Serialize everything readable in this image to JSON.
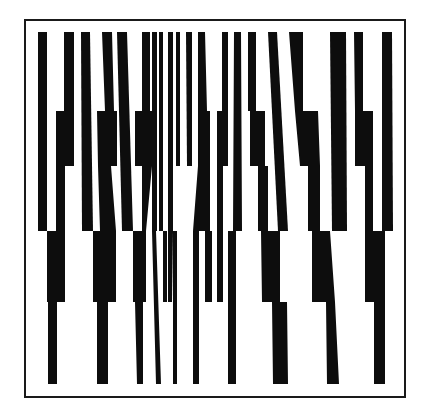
{
  "artwork": {
    "title": "",
    "background": "#ffffff",
    "ink": "#0d0d0d",
    "frame": {
      "x": 25,
      "y": 20,
      "width": 380,
      "height": 377,
      "stroke": "#1a1a1a"
    },
    "bands_y": [
      32,
      111,
      166,
      231,
      302,
      384
    ],
    "bars": [
      [
        [
          38,
          32
        ],
        [
          47,
          32
        ],
        [
          47,
          231
        ],
        [
          38,
          231
        ]
      ],
      [
        [
          64,
          32
        ],
        [
          74,
          32
        ],
        [
          74,
          111
        ],
        [
          74,
          166
        ],
        [
          65,
          166
        ],
        [
          65,
          302
        ],
        [
          57,
          302
        ],
        [
          57,
          384
        ],
        [
          48,
          384
        ],
        [
          48,
          302
        ],
        [
          47,
          302
        ],
        [
          47,
          231
        ],
        [
          56,
          231
        ],
        [
          56,
          111
        ],
        [
          64,
          111
        ]
      ],
      [
        [
          81,
          32
        ],
        [
          90,
          32
        ],
        [
          93,
          231
        ],
        [
          82,
          231
        ]
      ],
      [
        [
          102,
          32
        ],
        [
          112,
          32
        ],
        [
          114,
          111
        ],
        [
          117,
          111
        ],
        [
          117,
          166
        ],
        [
          111,
          166
        ],
        [
          116,
          231
        ],
        [
          116,
          302
        ],
        [
          108,
          302
        ],
        [
          108,
          384
        ],
        [
          97,
          384
        ],
        [
          97,
          302
        ],
        [
          93,
          302
        ],
        [
          93,
          231
        ],
        [
          100,
          231
        ],
        [
          98,
          166
        ],
        [
          97,
          111
        ],
        [
          105,
          111
        ]
      ],
      [
        [
          117,
          32
        ],
        [
          127,
          32
        ],
        [
          133,
          231
        ],
        [
          122,
          231
        ]
      ],
      [
        [
          142,
          32
        ],
        [
          150,
          32
        ],
        [
          150,
          111
        ],
        [
          152,
          111
        ],
        [
          152,
          166
        ],
        [
          146,
          231
        ],
        [
          146,
          302
        ],
        [
          143,
          302
        ],
        [
          143,
          384
        ],
        [
          137,
          384
        ],
        [
          135,
          302
        ],
        [
          133,
          302
        ],
        [
          133,
          231
        ],
        [
          142,
          231
        ],
        [
          142,
          166
        ],
        [
          135,
          166
        ],
        [
          135,
          111
        ],
        [
          142,
          111
        ]
      ],
      [
        [
          152,
          32
        ],
        [
          157,
          32
        ],
        [
          157,
          231
        ],
        [
          156,
          231
        ],
        [
          161,
          384
        ],
        [
          156,
          384
        ],
        [
          152,
          231
        ]
      ],
      [
        [
          159,
          32
        ],
        [
          163,
          32
        ],
        [
          163,
          231
        ],
        [
          167,
          231
        ],
        [
          167,
          302
        ],
        [
          163,
          302
        ],
        [
          163,
          231
        ],
        [
          159,
          231
        ]
      ],
      [
        [
          168,
          32
        ],
        [
          173,
          32
        ],
        [
          173,
          231
        ],
        [
          172,
          302
        ],
        [
          168,
          302
        ],
        [
          168,
          231
        ]
      ],
      [
        [
          176,
          32
        ],
        [
          180,
          32
        ],
        [
          180,
          166
        ],
        [
          176,
          166
        ]
      ],
      [
        [
          173,
          231
        ],
        [
          177,
          231
        ],
        [
          177,
          384
        ],
        [
          173,
          384
        ]
      ],
      [
        [
          186,
          32
        ],
        [
          192,
          32
        ],
        [
          192,
          166
        ],
        [
          187,
          166
        ]
      ],
      [
        [
          198,
          32
        ],
        [
          205,
          32
        ],
        [
          207,
          111
        ],
        [
          210,
          111
        ],
        [
          210,
          231
        ],
        [
          199,
          231
        ],
        [
          199,
          384
        ],
        [
          193,
          384
        ],
        [
          193,
          231
        ],
        [
          198,
          166
        ]
      ],
      [
        [
          205,
          231
        ],
        [
          212,
          231
        ],
        [
          212,
          302
        ],
        [
          205,
          302
        ]
      ],
      [
        [
          222,
          32
        ],
        [
          228,
          32
        ],
        [
          228,
          166
        ],
        [
          223,
          166
        ],
        [
          223,
          302
        ],
        [
          217,
          302
        ],
        [
          217,
          166
        ],
        [
          217,
          111
        ],
        [
          222,
          111
        ]
      ],
      [
        [
          234,
          32
        ],
        [
          241,
          32
        ],
        [
          242,
          231
        ],
        [
          236,
          231
        ],
        [
          236,
          384
        ],
        [
          228,
          384
        ],
        [
          228,
          231
        ],
        [
          233,
          231
        ]
      ],
      [
        [
          248,
          32
        ],
        [
          256,
          32
        ],
        [
          256,
          111
        ],
        [
          265,
          111
        ],
        [
          265,
          166
        ],
        [
          268,
          166
        ],
        [
          268,
          231
        ],
        [
          280,
          231
        ],
        [
          280,
          302
        ],
        [
          287,
          302
        ],
        [
          288,
          384
        ],
        [
          273,
          384
        ],
        [
          272,
          302
        ],
        [
          262,
          302
        ],
        [
          261,
          231
        ],
        [
          258,
          231
        ],
        [
          258,
          166
        ],
        [
          250,
          166
        ],
        [
          250,
          111
        ],
        [
          248,
          111
        ]
      ],
      [
        [
          268,
          32
        ],
        [
          277,
          32
        ],
        [
          288,
          231
        ],
        [
          278,
          231
        ]
      ],
      [
        [
          289,
          32
        ],
        [
          303,
          32
        ],
        [
          303,
          111
        ],
        [
          318,
          111
        ],
        [
          320,
          166
        ],
        [
          320,
          231
        ],
        [
          330,
          231
        ],
        [
          335,
          302
        ],
        [
          339,
          384
        ],
        [
          327,
          384
        ],
        [
          326,
          302
        ],
        [
          312,
          302
        ],
        [
          312,
          231
        ],
        [
          308,
          231
        ],
        [
          308,
          166
        ],
        [
          300,
          166
        ],
        [
          295,
          111
        ]
      ],
      [
        [
          330,
          32
        ],
        [
          346,
          32
        ],
        [
          347,
          231
        ],
        [
          332,
          231
        ]
      ],
      [
        [
          354,
          32
        ],
        [
          363,
          32
        ],
        [
          363,
          111
        ],
        [
          373,
          111
        ],
        [
          373,
          166
        ],
        [
          373,
          231
        ],
        [
          385,
          231
        ],
        [
          385,
          302
        ],
        [
          385,
          384
        ],
        [
          374,
          384
        ],
        [
          374,
          302
        ],
        [
          365,
          302
        ],
        [
          365,
          231
        ],
        [
          365,
          166
        ],
        [
          355,
          166
        ],
        [
          355,
          111
        ]
      ],
      [
        [
          382,
          32
        ],
        [
          392,
          32
        ],
        [
          393,
          231
        ],
        [
          382,
          231
        ]
      ]
    ]
  }
}
